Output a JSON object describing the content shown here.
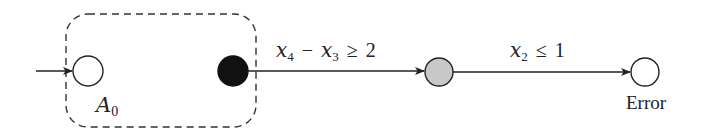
{
  "diagram": {
    "type": "automaton",
    "group": {
      "label_main": "A",
      "label_sub": "0",
      "style": "dashed rounded box"
    },
    "states": [
      {
        "id": "init",
        "fill": "#ffffff",
        "initial": true
      },
      {
        "id": "exit",
        "fill": "#111111"
      },
      {
        "id": "mid",
        "fill": "#c8c8c8"
      },
      {
        "id": "error",
        "fill": "#ffffff",
        "label": "Error"
      }
    ],
    "transitions": [
      {
        "from": "exit",
        "to": "mid",
        "guard": {
          "a_var": "x",
          "a_sub": "4",
          "op1": "−",
          "b_var": "x",
          "b_sub": "3",
          "op2": "≥",
          "rhs": "2"
        }
      },
      {
        "from": "mid",
        "to": "error",
        "guard": {
          "a_var": "x",
          "a_sub": "2",
          "op": "≤",
          "rhs": "1"
        }
      }
    ]
  }
}
